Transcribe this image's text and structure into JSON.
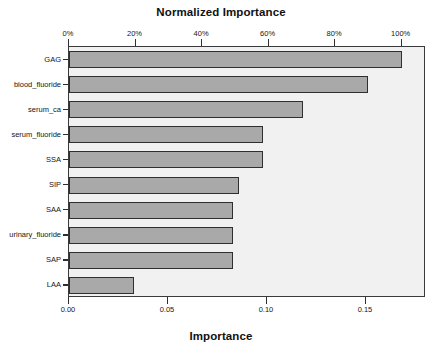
{
  "chart_data": {
    "type": "bar",
    "orientation": "horizontal",
    "title": "",
    "top_axis_title": "Normalized Importance",
    "bottom_axis_title": "Importance",
    "xlabel": "Importance",
    "ylabel": "",
    "categories": [
      "GAG",
      "blood_fluoride",
      "serum_ca",
      "serum_fluoride",
      "SSA",
      "SIP",
      "SAA",
      "urinary_fluoride",
      "SAP",
      "LAA"
    ],
    "values": [
      0.168,
      0.151,
      0.118,
      0.098,
      0.098,
      0.086,
      0.083,
      0.083,
      0.083,
      0.033
    ],
    "normalized_values_percent": [
      100,
      90,
      70,
      58,
      58,
      51,
      49,
      49,
      49,
      20
    ],
    "xlim": [
      0.0,
      0.1803
    ],
    "bottom_ticks": [
      0.0,
      0.05,
      0.1,
      0.15
    ],
    "bottom_tick_labels": [
      "0.00",
      "0.05",
      "0.10",
      "0.15"
    ],
    "top_ticks_percent": [
      0,
      20,
      40,
      60,
      80,
      100
    ],
    "top_tick_labels": [
      "0%",
      "20%",
      "40%",
      "60%",
      "80%",
      "100%"
    ],
    "grid": false,
    "legend": null,
    "bar_fill_color": "#a9a9a9",
    "bar_edge_color": "#2f2f2f",
    "plot_background_color": "#f1f1f1",
    "frame_color": "#3a3a3a"
  }
}
